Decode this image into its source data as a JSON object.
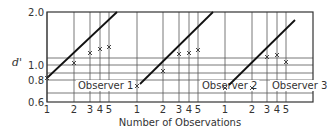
{
  "chart_data": {
    "type": "line",
    "title": "",
    "xlabel": "Number of Observations",
    "ylabel": "d'",
    "ylim": [
      0.6,
      2.0
    ],
    "y_ticks": [
      {
        "label": "2.0",
        "y": 12
      },
      {
        "label": "1.0",
        "y": 65
      },
      {
        "label": "0.8",
        "y": 80
      },
      {
        "label": "0.6",
        "y": 102
      }
    ],
    "h_grid_y": [
      58,
      65,
      73,
      80,
      93
    ],
    "frame": {
      "left": 47,
      "top": 12,
      "right": 313,
      "bottom": 102
    },
    "grid": true,
    "series": [
      {
        "name": "Observer 1",
        "x": [
          1,
          2,
          3,
          4,
          5
        ],
        "x_px": [
          47,
          74,
          90,
          100,
          109
        ],
        "values": [
          0.8,
          1.02,
          1.2,
          1.25,
          1.28
        ],
        "marker_y_px": [
          78,
          63,
          53,
          49,
          47
        ],
        "prediction_line": [
          [
            47,
            78
          ],
          [
            117,
            12
          ]
        ],
        "label_x": 78
      },
      {
        "name": "Observer 2",
        "x": [
          1,
          2,
          3,
          4,
          5
        ],
        "x_px": [
          137,
          163,
          179,
          189,
          198
        ],
        "values": [
          0.75,
          0.9,
          1.18,
          1.2,
          1.24
        ],
        "marker_y_px": [
          86,
          71,
          54,
          53,
          50
        ],
        "prediction_line": [
          [
            140,
            84
          ],
          [
            213,
            12
          ]
        ],
        "label_x": 202
      },
      {
        "name": "Observer 3",
        "x": [
          1,
          2,
          3,
          4,
          5
        ],
        "x_px": [
          225,
          252,
          267,
          277,
          286
        ],
        "values": [
          0.74,
          0.74,
          1.12,
          1.15,
          1.05
        ],
        "marker_y_px": [
          88,
          88,
          57,
          55,
          62
        ],
        "prediction_line": [
          [
            229,
            85
          ],
          [
            295,
            20
          ]
        ],
        "label_x": 272
      }
    ]
  }
}
